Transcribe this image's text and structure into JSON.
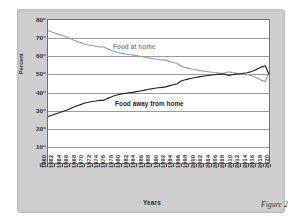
{
  "figure": {
    "caption": "Figure 2",
    "xlabel": "Years",
    "ylabel": "Percent"
  },
  "series_labels": {
    "at_home": "Food at home",
    "away_from_home": "Food away from home"
  },
  "chart_data": {
    "type": "line",
    "title": "",
    "xlabel": "Years",
    "ylabel": "Percent",
    "xlim": [
      1960,
      2020
    ],
    "ylim": [
      0,
      80
    ],
    "grid": true,
    "legend": "inline-labels",
    "ytick_labels": [
      "0",
      "10",
      "20",
      "30",
      "40",
      "50",
      "60",
      "70",
      "80"
    ],
    "yticks": [
      0,
      10,
      20,
      30,
      40,
      50,
      60,
      70,
      80
    ],
    "xtick_labels": [
      "1960",
      "1962",
      "1964",
      "1966",
      "1968",
      "1970",
      "1972",
      "1974",
      "1976",
      "1978",
      "1980",
      "1982",
      "1984",
      "1986",
      "1988",
      "1990",
      "1992",
      "1994",
      "1996",
      "1998",
      "2000",
      "2002",
      "2004",
      "2006",
      "2008",
      "2010",
      "2012",
      "2014",
      "2016",
      "2018",
      "2020"
    ],
    "x": [
      1960,
      1961,
      1962,
      1963,
      1964,
      1965,
      1966,
      1967,
      1968,
      1969,
      1970,
      1971,
      1972,
      1973,
      1974,
      1975,
      1976,
      1977,
      1978,
      1979,
      1980,
      1981,
      1982,
      1983,
      1984,
      1985,
      1986,
      1987,
      1988,
      1989,
      1990,
      1991,
      1992,
      1993,
      1994,
      1995,
      1996,
      1997,
      1998,
      1999,
      2000,
      2001,
      2002,
      2003,
      2004,
      2005,
      2006,
      2007,
      2008,
      2009,
      2010,
      2011,
      2012,
      2013,
      2014,
      2015,
      2016,
      2017,
      2018,
      2019,
      2020
    ],
    "series": [
      {
        "name": "Food at home",
        "color": "#9a9a9a",
        "values": [
          74.0,
          73.3,
          72.6,
          71.9,
          71.2,
          70.5,
          69.6,
          68.7,
          68.0,
          67.2,
          66.4,
          66.0,
          65.6,
          65.3,
          64.9,
          65.0,
          64.0,
          63.2,
          62.4,
          61.8,
          61.3,
          61.0,
          60.7,
          60.5,
          60.1,
          59.7,
          59.4,
          58.9,
          58.5,
          58.2,
          57.9,
          57.7,
          57.4,
          56.7,
          56.2,
          55.8,
          54.3,
          53.6,
          53.1,
          52.6,
          52.2,
          51.8,
          51.5,
          51.2,
          50.9,
          50.6,
          50.4,
          50.2,
          50.3,
          51.0,
          50.6,
          50.3,
          50.1,
          49.8,
          49.5,
          49.0,
          48.3,
          47.3,
          46.2,
          45.6,
          50.5
        ]
      },
      {
        "name": "Food away from home",
        "color": "#1f1f1f",
        "values": [
          26.0,
          26.7,
          27.4,
          28.1,
          28.8,
          29.5,
          30.4,
          31.3,
          32.0,
          32.8,
          33.6,
          34.0,
          34.4,
          34.7,
          35.1,
          35.0,
          36.0,
          36.8,
          37.6,
          38.2,
          38.7,
          39.0,
          39.3,
          39.5,
          39.9,
          40.3,
          40.6,
          41.1,
          41.5,
          41.8,
          42.1,
          42.3,
          42.6,
          43.3,
          43.8,
          44.2,
          45.7,
          46.4,
          46.9,
          47.4,
          47.8,
          48.2,
          48.5,
          48.8,
          49.1,
          49.4,
          49.6,
          49.8,
          49.7,
          49.0,
          49.4,
          49.7,
          49.9,
          50.2,
          50.5,
          51.0,
          51.7,
          52.7,
          53.8,
          54.4,
          49.5
        ]
      }
    ]
  }
}
